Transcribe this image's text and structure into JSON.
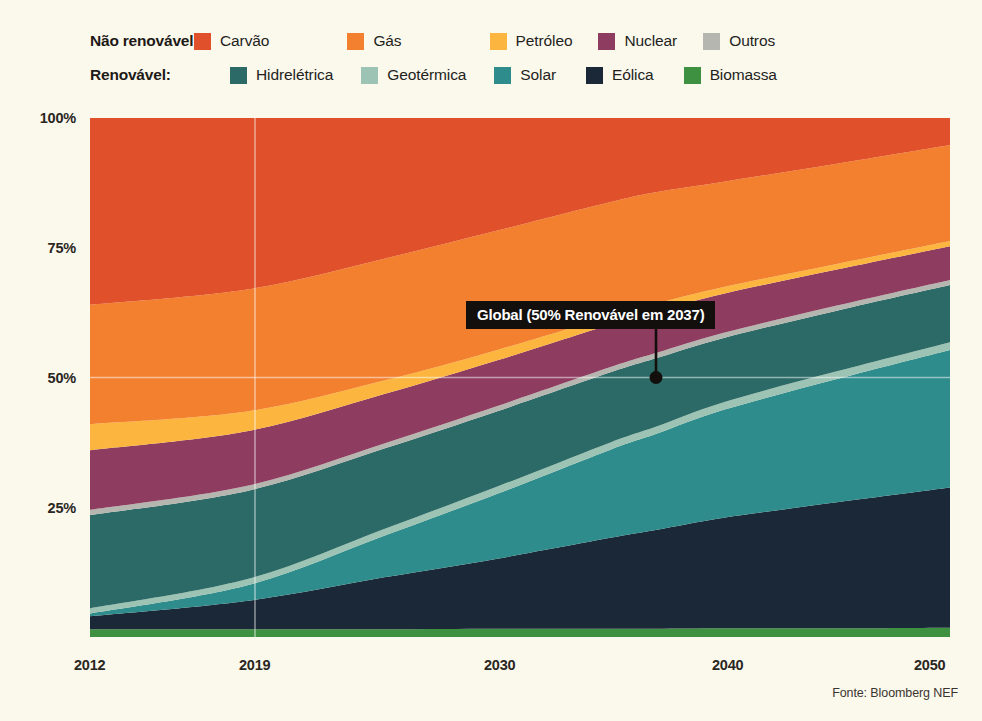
{
  "legend": {
    "rows": [
      {
        "group_label": "Não renovável:",
        "items": [
          {
            "label": "Carvão",
            "color": "#e0502a"
          },
          {
            "label": "Gás",
            "color": "#f3802f"
          },
          {
            "label": "Petróleo",
            "color": "#fcb63f"
          },
          {
            "label": "Nuclear",
            "color": "#8e3d61"
          },
          {
            "label": "Outros",
            "color": "#b6b6b0"
          }
        ]
      },
      {
        "group_label": "Renovável:",
        "items": [
          {
            "label": "Hidrelétrica",
            "color": "#2b6a67"
          },
          {
            "label": "Geotérmica",
            "color": "#9cc3b4"
          },
          {
            "label": "Solar",
            "color": "#2e8c8c"
          },
          {
            "label": "Eólica",
            "color": "#1b2838"
          },
          {
            "label": "Biomassa",
            "color": "#3f9142"
          }
        ]
      }
    ]
  },
  "annotation": {
    "text": "Global (50% Renovável em 2037)",
    "point_year": 2037,
    "point_value": 50,
    "background": "#120f0d",
    "text_color": "#ffffff"
  },
  "source": "Fonte: Bloomberg NEF",
  "chart_data": {
    "type": "area",
    "stacked": true,
    "normalized": true,
    "title": "",
    "subtitle": "",
    "xlabel": "",
    "ylabel": "",
    "xlim": [
      2012,
      2050
    ],
    "ylim": [
      0,
      100
    ],
    "grid": "50% horizontal line and 2019 vertical line only",
    "legend_position": "top",
    "x_ticks": [
      2012,
      2019,
      2030,
      2040,
      2050
    ],
    "x_tick_labels": [
      "2012",
      "2019",
      "2030",
      "2040",
      "2050"
    ],
    "y_ticks": [
      25,
      50,
      75,
      100
    ],
    "y_tick_labels": [
      "25%",
      "50%",
      "75%",
      "100%"
    ],
    "x": [
      2012,
      2019,
      2025,
      2030,
      2035,
      2037,
      2040,
      2045,
      2050
    ],
    "series": [
      {
        "name": "Biomassa",
        "color": "#3f9142",
        "values": [
          1.5,
          1.5,
          1.5,
          1.6,
          1.6,
          1.6,
          1.7,
          1.7,
          1.8
        ]
      },
      {
        "name": "Eólica",
        "color": "#1b2838",
        "values": [
          2.5,
          5.5,
          10.0,
          13.5,
          17.5,
          19.0,
          21.5,
          24.5,
          27.0
        ]
      },
      {
        "name": "Solar",
        "color": "#2e8c8c",
        "values": [
          0.5,
          3.0,
          8.0,
          12.5,
          17.0,
          18.5,
          21.0,
          24.0,
          26.5
        ]
      },
      {
        "name": "Geotérmica",
        "color": "#9cc3b4",
        "values": [
          1.0,
          1.2,
          1.3,
          1.4,
          1.4,
          1.4,
          1.5,
          1.5,
          1.5
        ]
      },
      {
        "name": "Hidrelétrica",
        "color": "#2b6a67",
        "values": [
          18.0,
          17.0,
          15.5,
          14.5,
          13.5,
          13.2,
          12.5,
          11.8,
          11.0
        ]
      },
      {
        "name": "Outros",
        "color": "#b6b6b0",
        "values": [
          1.0,
          1.0,
          1.0,
          1.0,
          1.0,
          1.0,
          1.0,
          1.0,
          1.0
        ]
      },
      {
        "name": "Nuclear",
        "color": "#8e3d61",
        "values": [
          11.5,
          10.5,
          9.5,
          8.8,
          8.2,
          8.0,
          7.6,
          7.0,
          6.5
        ]
      },
      {
        "name": "Petróleo",
        "color": "#fcb63f",
        "values": [
          5.0,
          3.8,
          2.6,
          2.0,
          1.6,
          1.5,
          1.3,
          1.1,
          1.0
        ]
      },
      {
        "name": "Gás",
        "color": "#f3802f",
        "values": [
          23.0,
          23.5,
          23.5,
          23.0,
          22.0,
          21.5,
          20.5,
          19.5,
          18.5
        ]
      },
      {
        "name": "Carvão",
        "color": "#e0502a",
        "values": [
          36.0,
          33.0,
          27.1,
          21.7,
          16.2,
          14.3,
          12.4,
          8.9,
          5.2
        ]
      }
    ]
  }
}
